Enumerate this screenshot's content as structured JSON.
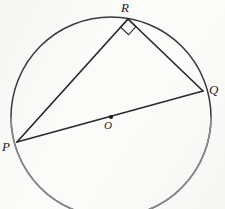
{
  "figure": {
    "type": "circle-geometry-diagram",
    "background_color": "#fbfbf9",
    "stroke_color": "#2a2a2a",
    "circle_stroke_color": "#3a3a3a",
    "circle_faint_stroke_color": "#8d8d8d",
    "canvas": {
      "width": 225,
      "height": 209
    },
    "circle": {
      "center_x": 111,
      "center_y": 117,
      "radius": 100,
      "center_dot_radius": 2.1
    },
    "points": [
      {
        "id": "P",
        "label": "P",
        "x": 17,
        "y": 142
      },
      {
        "id": "Q",
        "label": "Q",
        "x": 203,
        "y": 91
      },
      {
        "id": "R",
        "label": "R",
        "x": 128,
        "y": 19
      },
      {
        "id": "O",
        "label": "O",
        "x": 111,
        "y": 117
      }
    ],
    "segments": [
      {
        "id": "PQ",
        "from": "P",
        "to": "Q",
        "kind": "diameter"
      },
      {
        "id": "PR",
        "from": "P",
        "to": "R",
        "kind": "chord"
      },
      {
        "id": "RQ",
        "from": "R",
        "to": "Q",
        "kind": "chord"
      }
    ],
    "right_angle_marker": {
      "at": "R",
      "size": 11,
      "label": "right-angle-square"
    },
    "labels": {
      "P": "P",
      "Q": "Q",
      "R": "R",
      "O": "O"
    }
  }
}
